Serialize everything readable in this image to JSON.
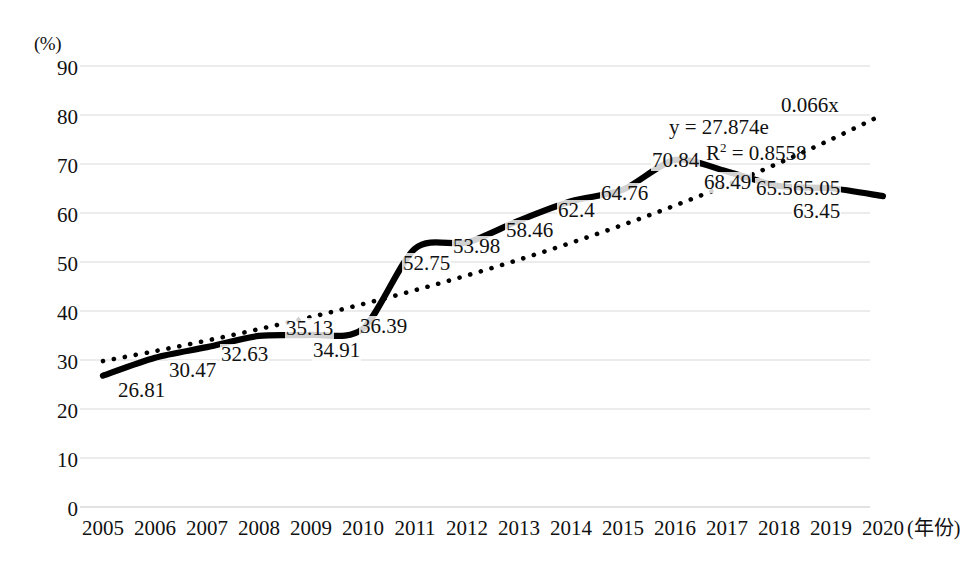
{
  "chart_data": {
    "type": "line",
    "title": "",
    "xlabel": "(年份)",
    "ylabel": "(%)",
    "ylim": [
      0,
      90
    ],
    "ytick_step": 10,
    "grid": true,
    "legend": false,
    "categories": [
      "2005",
      "2006",
      "2007",
      "2008",
      "2009",
      "2010",
      "2011",
      "2012",
      "2013",
      "2014",
      "2015",
      "2016",
      "2017",
      "2018",
      "2019",
      "2020"
    ],
    "yticks": [
      "90",
      "80",
      "70",
      "60",
      "50",
      "40",
      "30",
      "20",
      "10",
      "0"
    ],
    "series": [
      {
        "name": "data-series",
        "style": "solid-thick-black",
        "values": [
          26.81,
          30.47,
          32.63,
          34.91,
          35.13,
          36.39,
          52.75,
          53.98,
          58.46,
          62.4,
          64.76,
          70.84,
          68.49,
          65.5,
          65.05,
          63.45
        ]
      },
      {
        "name": "exponential-trendline",
        "style": "dotted-black",
        "equation": "y = 27.874e",
        "equation_exponent": "0.066x",
        "r_squared": "R² = 0.8558",
        "values": [
          29.78,
          31.81,
          33.98,
          36.3,
          38.77,
          41.42,
          44.24,
          47.26,
          50.48,
          53.92,
          57.6,
          61.53,
          65.72,
          70.2,
          75.0,
          80.11
        ]
      }
    ],
    "data_labels": [
      {
        "text": "26.81",
        "x": 117,
        "y": 380
      },
      {
        "text": "30.47",
        "x": 168,
        "y": 360
      },
      {
        "text": "32.63",
        "x": 220,
        "y": 344
      },
      {
        "text": "34.91",
        "x": 312,
        "y": 340
      },
      {
        "text": "35.13",
        "x": 285,
        "y": 318
      },
      {
        "text": "36.39",
        "x": 359,
        "y": 316
      },
      {
        "text": "52.75",
        "x": 402,
        "y": 253
      },
      {
        "text": "53.98",
        "x": 452,
        "y": 236
      },
      {
        "text": "58.46",
        "x": 505,
        "y": 220
      },
      {
        "text": "62.4",
        "x": 557,
        "y": 200
      },
      {
        "text": "64.76",
        "x": 600,
        "y": 183
      },
      {
        "text": "70.84",
        "x": 651,
        "y": 150
      },
      {
        "text": "68.49",
        "x": 703,
        "y": 172
      },
      {
        "text": "65.5",
        "x": 755,
        "y": 178
      },
      {
        "text": "65.05",
        "x": 792,
        "y": 178
      },
      {
        "text": "63.45",
        "x": 792,
        "y": 201
      }
    ],
    "equation_label": {
      "text": "y = 27.874e",
      "x": 669,
      "y": 116
    },
    "equation_exponent_label": {
      "text": "0.066x",
      "x": 781,
      "y": 94
    },
    "r2_label": {
      "text": "R",
      "sup": "2",
      "rest": " = 0.8558",
      "x": 706,
      "y": 142
    },
    "axis_colors": {
      "grid": "#d9d9d9",
      "line": "#000000",
      "text": "#111111"
    }
  }
}
